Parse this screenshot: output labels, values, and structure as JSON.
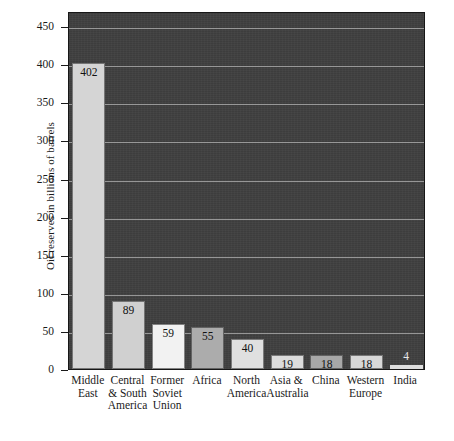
{
  "chart_data": {
    "type": "bar",
    "title": "",
    "xlabel": "",
    "ylabel": "Oil reserves in billions of barrels",
    "ylim": [
      0,
      470
    ],
    "yticks": [
      0,
      50,
      100,
      150,
      200,
      250,
      300,
      350,
      400,
      450
    ],
    "grid": true,
    "legend": false,
    "plot_background": "#3f3f3f",
    "gridline_color": "#b4b4b4",
    "categories": [
      "Middle East",
      "Central & South America",
      "Former Soviet Union",
      "Africa",
      "North America",
      "Asia & Australia",
      "China",
      "Western Europe",
      "India"
    ],
    "values": [
      402,
      89,
      59,
      55,
      40,
      19,
      18,
      18,
      4
    ],
    "bar_colors": [
      "#d5d5d5",
      "#d0d0d0",
      "#f2f2f2",
      "#acacac",
      "#e0e0e0",
      "#dcdcdc",
      "#a8a8a8",
      "#d8d8d8",
      "#dedede"
    ]
  },
  "axis": {
    "y_title": "Oil reserves in billions of barrels",
    "tick_labels": [
      "450",
      "400",
      "350",
      "300",
      "250",
      "200",
      "150",
      "100",
      "50",
      "0"
    ]
  },
  "bars": [
    {
      "label_lines": [
        "Middle",
        "East"
      ],
      "value": "402",
      "color": "#d5d5d5"
    },
    {
      "label_lines": [
        "Central",
        "& South",
        "America"
      ],
      "value": "89",
      "color": "#d0d0d0"
    },
    {
      "label_lines": [
        "Former",
        "Soviet",
        "Union"
      ],
      "value": "59",
      "color": "#f2f2f2"
    },
    {
      "label_lines": [
        "Africa"
      ],
      "value": "55",
      "color": "#acacac"
    },
    {
      "label_lines": [
        "North",
        "America"
      ],
      "value": "40",
      "color": "#e0e0e0"
    },
    {
      "label_lines": [
        "Asia &",
        "Australia"
      ],
      "value": "19",
      "color": "#dcdcdc"
    },
    {
      "label_lines": [
        "China"
      ],
      "value": "18",
      "color": "#a8a8a8"
    },
    {
      "label_lines": [
        "Western",
        "Europe"
      ],
      "value": "18",
      "color": "#d8d8d8"
    },
    {
      "label_lines": [
        "India"
      ],
      "value": "4",
      "color": "#dedede"
    }
  ]
}
